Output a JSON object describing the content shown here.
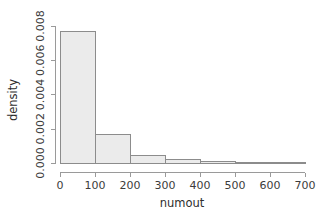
{
  "chart_data": {
    "type": "bar",
    "title": "",
    "subtitle": "",
    "xlabel": "numout",
    "ylabel": "density",
    "xlim": [
      0,
      700
    ],
    "ylim": [
      0,
      0.008
    ],
    "grid": false,
    "legend": false,
    "bin_width": 100,
    "bin_edges": [
      0,
      100,
      200,
      300,
      400,
      500,
      600,
      700
    ],
    "categories": [
      "0-100",
      "100-200",
      "200-300",
      "300-400",
      "400-500",
      "500-600",
      "600-700"
    ],
    "values": [
      0.00765,
      0.00165,
      0.00045,
      0.00018,
      8e-05,
      4e-05,
      2e-05
    ],
    "xticks": [
      0,
      100,
      200,
      300,
      400,
      500,
      600,
      700
    ],
    "xtick_labels": [
      "0",
      "100",
      "200",
      "300",
      "400",
      "500",
      "600",
      "700"
    ],
    "yticks": [
      0.0,
      0.002,
      0.004,
      0.006,
      0.008
    ],
    "ytick_labels": [
      "0.000",
      "0.002",
      "0.004",
      "0.006",
      "0.008"
    ],
    "bar_fill": "#ebebeb",
    "bar_stroke": "#8c8c8c",
    "axis_color": "#9a9a9a",
    "text_color": "#3b3b3b",
    "background": "#ffffff"
  }
}
